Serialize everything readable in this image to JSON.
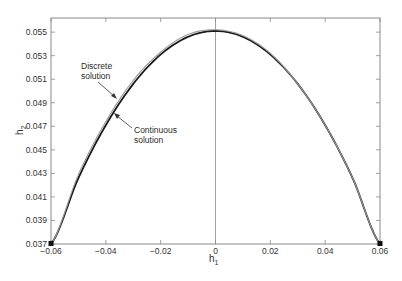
{
  "chart_data": {
    "type": "line",
    "title": "",
    "xlabel": "h1",
    "ylabel": "h2",
    "xlim": [
      -0.06,
      0.06
    ],
    "ylim": [
      0.037,
      0.0562
    ],
    "grid": false,
    "legend": null,
    "x_ticks": [
      "-0.06",
      "-0.04",
      "-0.02",
      "0",
      "0.02",
      "0.04",
      "0.06"
    ],
    "y_ticks": [
      "0.037",
      "0.039",
      "0.041",
      "0.043",
      "0.045",
      "0.047",
      "0.049",
      "0.051",
      "0.053",
      "0.055"
    ],
    "vertical_reference_line": {
      "x": 0
    },
    "series": [
      {
        "name": "Continuous solution",
        "style": "thick-black",
        "x": [
          -0.06,
          -0.05,
          -0.04,
          -0.03,
          -0.02,
          -0.01,
          0.0,
          0.01,
          0.02,
          0.03,
          0.04,
          0.05,
          0.06
        ],
        "y": [
          0.037,
          0.0426,
          0.0471,
          0.0506,
          0.0531,
          0.0546,
          0.0551,
          0.0546,
          0.0531,
          0.0506,
          0.0471,
          0.0426,
          0.037
        ]
      },
      {
        "name": "Discrete solution",
        "style": "thin-gray",
        "x": [
          -0.06,
          -0.05,
          -0.04,
          -0.03,
          -0.02,
          -0.01,
          0.0,
          0.01,
          0.02,
          0.03,
          0.04,
          0.05,
          0.06
        ],
        "y": [
          0.037,
          0.0429,
          0.0474,
          0.0509,
          0.0533,
          0.0548,
          0.0552,
          0.0547,
          0.0532,
          0.0506,
          0.0471,
          0.0426,
          0.037
        ]
      }
    ],
    "markers": [
      {
        "x": -0.06,
        "y": 0.037,
        "shape": "square"
      },
      {
        "x": 0.06,
        "y": 0.037,
        "shape": "square"
      }
    ],
    "annotations": [
      {
        "text_line1": "Discrete",
        "text_line2": "solution",
        "points_to": "Discrete solution"
      },
      {
        "text_line1": "Continuous",
        "text_line2": "solution",
        "points_to": "Continuous solution"
      }
    ]
  },
  "labels": {
    "xlabel_main": "h",
    "xlabel_sub": "1",
    "ylabel_main": "h",
    "ylabel_sub": "2",
    "annot_discrete_1": "Discrete",
    "annot_discrete_2": "solution",
    "annot_continuous_1": "Continuous",
    "annot_continuous_2": "solution"
  },
  "colors": {
    "frame": "#8a8a8a",
    "continuous": "#1a1a1a",
    "discrete": "#9a9a9a",
    "text": "#333333"
  }
}
